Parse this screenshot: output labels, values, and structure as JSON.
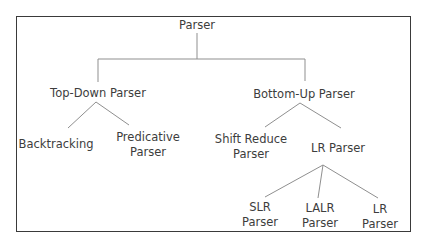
{
  "diagram": {
    "title": "Parser",
    "nodes": {
      "root": {
        "label": "Parser"
      },
      "top_down": {
        "label": "Top-Down Parser"
      },
      "bottom_up": {
        "label": "Bottom-Up Parser"
      },
      "backtracking": {
        "label": "Backtracking"
      },
      "predicative": {
        "line1": "Predicative",
        "line2": "Parser"
      },
      "shift_reduce": {
        "line1": "Shift Reduce",
        "line2": "Parser"
      },
      "lr_parser": {
        "label": "LR Parser"
      },
      "slr": {
        "line1": "SLR",
        "line2": "Parser"
      },
      "lalr": {
        "line1": "LALR",
        "line2": "Parser"
      },
      "lr": {
        "line1": "LR",
        "line2": "Parser"
      }
    },
    "edges": [
      [
        "Parser",
        "Top-Down Parser"
      ],
      [
        "Parser",
        "Bottom-Up Parser"
      ],
      [
        "Top-Down Parser",
        "Backtracking"
      ],
      [
        "Top-Down Parser",
        "Predicative Parser"
      ],
      [
        "Bottom-Up Parser",
        "Shift Reduce Parser"
      ],
      [
        "Bottom-Up Parser",
        "LR Parser"
      ],
      [
        "LR Parser",
        "SLR Parser"
      ],
      [
        "LR Parser",
        "LALR Parser"
      ],
      [
        "LR Parser",
        "LR Parser (canonical)"
      ]
    ],
    "colors": {
      "line": "#8a8a8a",
      "border": "#3a3a3a",
      "text": "#3d3d3d"
    }
  }
}
